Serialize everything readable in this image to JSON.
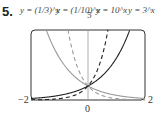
{
  "problem_number": "5.",
  "labels": {
    "l1": "y = (1/3)^x",
    "l2": "y = (1/10)^x",
    "ymax": "5",
    "l3": "y = 10^x",
    "l4": "y = 3^x"
  },
  "ticks": {
    "xmin": "−2",
    "xmax": "2",
    "origin": "0"
  },
  "chart_data": {
    "type": "line",
    "title": "",
    "xlabel": "",
    "ylabel": "",
    "xlim": [
      -2,
      2
    ],
    "ylim": [
      0,
      5
    ],
    "x_ticks": [
      "-2",
      "0",
      "2"
    ],
    "y_ticks": [
      "5"
    ],
    "grid": false,
    "series": [
      {
        "name": "y = (1/3)^x",
        "style": "gray solid",
        "x": [
          -2,
          -1.5,
          -1,
          -0.5,
          0,
          0.5,
          1,
          1.5,
          2
        ],
        "values": [
          9,
          5.2,
          3,
          1.73,
          1,
          0.58,
          0.33,
          0.19,
          0.11
        ]
      },
      {
        "name": "y = (1/10)^x",
        "style": "gray dashed",
        "x": [
          -2,
          -1,
          -0.7,
          -0.5,
          0,
          0.5,
          1,
          2
        ],
        "values": [
          100,
          10,
          5.01,
          3.16,
          1,
          0.32,
          0.1,
          0.01
        ]
      },
      {
        "name": "y = 10^x",
        "style": "black dashed",
        "x": [
          -2,
          -1,
          0,
          0.5,
          0.7,
          1,
          2
        ],
        "values": [
          0.01,
          0.1,
          1,
          3.16,
          5.01,
          10,
          100
        ]
      },
      {
        "name": "y = 3^x",
        "style": "black solid",
        "x": [
          -2,
          -1.5,
          -1,
          -0.5,
          0,
          0.5,
          1,
          1.5,
          2
        ],
        "values": [
          0.11,
          0.19,
          0.33,
          0.58,
          1,
          1.73,
          3,
          5.2,
          9
        ]
      }
    ]
  }
}
